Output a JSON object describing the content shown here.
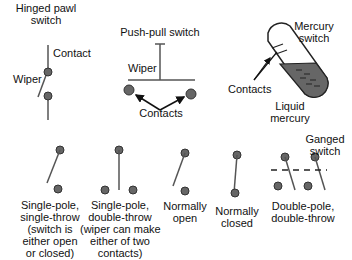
{
  "colors": {
    "background": "#ffffff",
    "line": "#555555",
    "contact_fill": "#666666",
    "mercury_fill": "#666666",
    "text": "#111111"
  },
  "hinged_pawl": {
    "title_line1": "Hinged pawl",
    "title_line2": "switch",
    "contact": "Contact",
    "wiper": "Wiper"
  },
  "push_pull": {
    "title": "Push-pull switch",
    "wiper": "Wiper",
    "contacts": "Contacts"
  },
  "mercury": {
    "title_line1": "Mercury",
    "title_line2": "switch",
    "contacts": "Contacts",
    "liquid_line1": "Liquid",
    "liquid_line2": "mercury"
  },
  "spst": {
    "l1": "Single-pole,",
    "l2": "single-throw",
    "l3": "(switch is",
    "l4": "either open",
    "l5": "or closed)"
  },
  "spdt": {
    "l1": "Single-pole,",
    "l2": "double-throw",
    "l3": "(wiper can make",
    "l4": "either of two",
    "l5": "contacts)"
  },
  "normally_open": {
    "l1": "Normally",
    "l2": "open"
  },
  "normally_closed": {
    "l1": "Normally",
    "l2": "closed"
  },
  "dpdt": {
    "l1": "Double-pole,",
    "l2": "double-throw",
    "ganged_line1": "Ganged",
    "ganged_line2": "switch"
  }
}
